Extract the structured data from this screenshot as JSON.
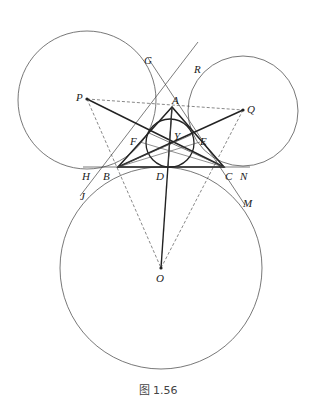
{
  "figure": {
    "caption": "图 1.56",
    "points": {
      "A": "A",
      "B": "B",
      "C": "C",
      "D": "D",
      "E": "E",
      "F": "F",
      "G": "G",
      "H": "H",
      "J": "J",
      "M": "M",
      "N": "N",
      "O": "O",
      "P": "P",
      "Q": "Q",
      "R": "R",
      "Y": "Y"
    },
    "colors": {
      "stroke": "#333333",
      "thin": "#555555",
      "background": "#ffffff"
    }
  }
}
